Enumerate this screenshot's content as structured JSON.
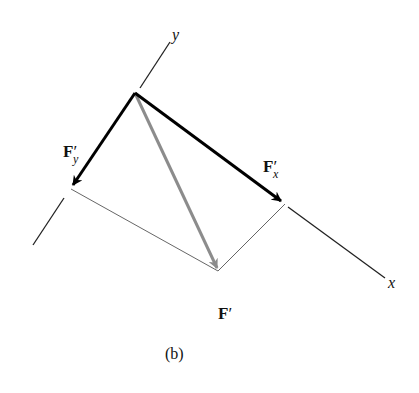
{
  "figure": {
    "caption": "(b)",
    "axes": {
      "x_label": "x",
      "y_label": "y"
    },
    "vectors": {
      "Fx": {
        "base": "F",
        "sub": "x",
        "prime": "′",
        "color": "#000000"
      },
      "Fy": {
        "base": "F",
        "sub": "y",
        "prime": "′",
        "color": "#000000"
      },
      "F": {
        "base": "F",
        "prime": "′",
        "color": "#8c8c8c"
      }
    },
    "colors": {
      "axis": "#222222",
      "construction": "#555555",
      "resultant": "#8c8c8c",
      "components": "#000000"
    }
  }
}
